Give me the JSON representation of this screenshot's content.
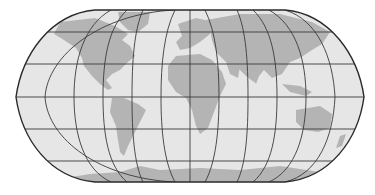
{
  "map": {
    "projection": "Robinson-like pseudocylindrical world map",
    "graticule_interval_degrees": 30,
    "colors": {
      "ocean": "#e6e6e6",
      "land": "#b4b4b4",
      "graticule": "#3a3a3a",
      "outline": "#2a2a2a",
      "background": "#ffffff"
    },
    "continents": [
      "North America",
      "South America",
      "Europe",
      "Africa",
      "Asia",
      "Australia",
      "Antarctica",
      "Greenland"
    ]
  }
}
